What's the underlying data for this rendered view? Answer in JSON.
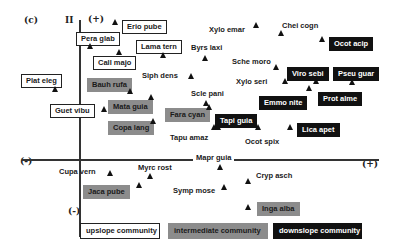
{
  "panel_label": "(c)",
  "axis": {
    "y_label": "II",
    "y_plus": "(+)",
    "y_minus": "(-)",
    "x_minus": "(-)",
    "x_plus": "(+)"
  },
  "species": {
    "erio_pube": "Erio pube",
    "pera_glab": "Pera glab",
    "lama_tern": "Lama tern",
    "call_majo": "Call majo",
    "plat_eleg": "Plat eleg",
    "guet_vibu": "Guet vibu",
    "bauh_rufa": "Bauh rufa",
    "mata_guia": "Mata guia",
    "copa_lang": "Copa lang",
    "fara_cyan": "Fara cyan",
    "jaca_pube": "Jaca pube",
    "inga_alba": "Inga alba",
    "ocot_acip": "Ocot acip",
    "viro_sebi": "Viro sebi",
    "pseu_guar": "Pseu guar",
    "emmo_nite": "Emmo nite",
    "prot_alme": "Prot alme",
    "tapi_guia": "Tapi guia",
    "lica_apet": "Lica apet",
    "xylo_emar": "Xylo emar",
    "chei_cogn": "Chei cogn",
    "byrs_laxi": "Byrs laxi",
    "sche_moro": "Sche moro",
    "xylo_seri": "Xylo seri",
    "siph_dens": "Siph dens",
    "scle_pani": "Scle pani",
    "tapu_amaz": "Tapu amaz",
    "ocot_spix": "Ocot spix",
    "mapr_guia": "Mapr guia",
    "cupa_vern": "Cupa vern",
    "myrc_rost": "Myrc rost",
    "cryp_asch": "Cryp asch",
    "symp_mose": "Symp mose"
  },
  "legend": {
    "upslope": "upslope community",
    "intermediate": "intermediate community",
    "downslope": "downslope community"
  },
  "colors": {
    "upslope_fill": "#ffffff",
    "intermediate_fill": "#8c8c8c",
    "downslope_fill": "#111111"
  }
}
